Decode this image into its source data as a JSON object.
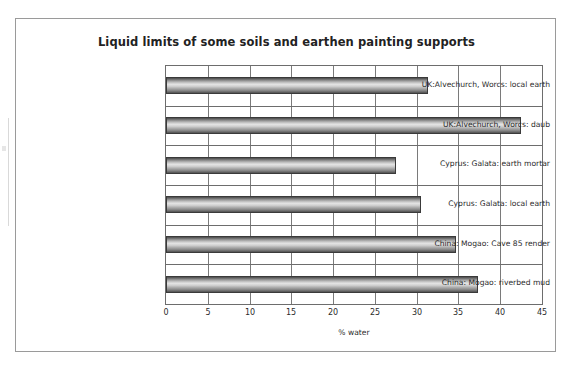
{
  "figure": {
    "title": "Liquid limits of some soils and earthen painting supports"
  },
  "chart_data": {
    "type": "bar",
    "orientation": "horizontal",
    "title": "Liquid limits of some soils and earthen painting supports",
    "xlabel": "% water",
    "ylabel": "",
    "xlim": [
      0,
      45
    ],
    "xticks": [
      "0",
      "5",
      "10",
      "15",
      "20",
      "25",
      "30",
      "35",
      "40",
      "45"
    ],
    "xtick_values": [
      0,
      5,
      10,
      15,
      20,
      25,
      30,
      35,
      40,
      45
    ],
    "grid": true,
    "legend": "none",
    "bar_fill": "#cfcfcf",
    "bar_edge": "#3a3a3a",
    "categories": [
      "UK:Alvechurch, Worcs: local earth",
      "UK:Alvechurch, Worcs: daub",
      "Cyprus: Galata: earth mortar",
      "Cyprus: Galata: local earth",
      "China: Mogao: Cave 85 render",
      "China: Mogao: riverbed mud"
    ],
    "values": [
      31.3,
      42.5,
      27.5,
      30.5,
      34.7,
      37.3
    ],
    "series": [
      {
        "name": "% water",
        "values": [
          31.3,
          42.5,
          27.5,
          30.5,
          34.7,
          37.3
        ]
      }
    ]
  }
}
